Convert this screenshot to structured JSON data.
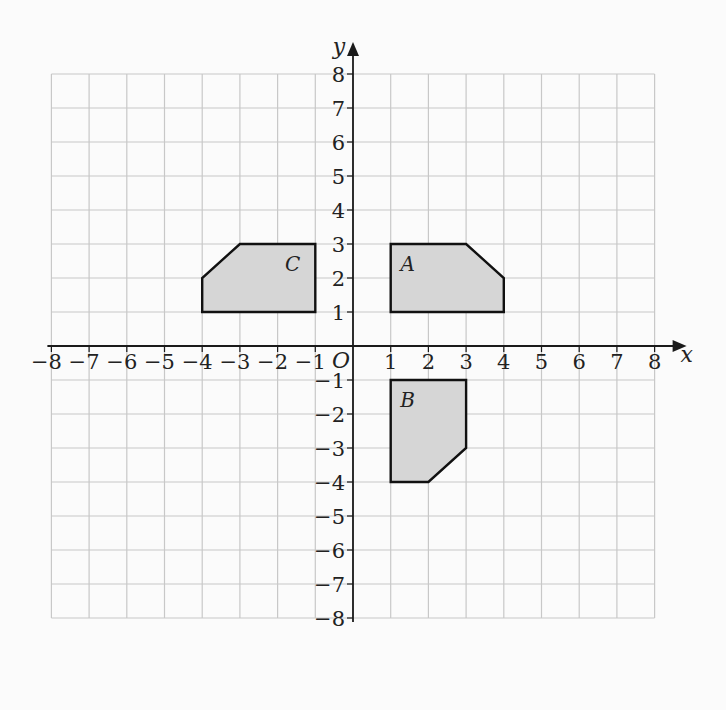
{
  "chart_data": {
    "type": "coordinate-grid",
    "title": "",
    "xlabel": "x",
    "ylabel": "y",
    "origin_label": "O",
    "xlim": [
      -8,
      8
    ],
    "ylim": [
      -8,
      8
    ],
    "grid": true,
    "x_ticks": [
      -8,
      -7,
      -6,
      -5,
      -4,
      -3,
      -2,
      -1,
      1,
      2,
      3,
      4,
      5,
      6,
      7,
      8
    ],
    "y_ticks": [
      8,
      7,
      6,
      5,
      4,
      3,
      2,
      1,
      -1,
      -2,
      -3,
      -4,
      -5,
      -6,
      -7,
      -8
    ],
    "shapes": [
      {
        "name": "A",
        "label_pos": [
          1.45,
          2.45
        ],
        "vertices": [
          [
            1,
            1
          ],
          [
            1,
            3
          ],
          [
            3,
            3
          ],
          [
            4,
            2
          ],
          [
            4,
            1
          ]
        ]
      },
      {
        "name": "B",
        "label_pos": [
          1.45,
          -1.55
        ],
        "vertices": [
          [
            1,
            -1
          ],
          [
            3,
            -1
          ],
          [
            3,
            -3
          ],
          [
            2,
            -4
          ],
          [
            1,
            -4
          ]
        ]
      },
      {
        "name": "C",
        "label_pos": [
          -1.6,
          2.45
        ],
        "vertices": [
          [
            -1,
            1
          ],
          [
            -1,
            3
          ],
          [
            -3,
            3
          ],
          [
            -4,
            2
          ],
          [
            -4,
            1
          ]
        ]
      }
    ]
  },
  "style": {
    "grid_color": "#c8c8c8",
    "axis_color": "#1a1a1a",
    "shape_fill": "#d6d6d6",
    "shape_stroke": "#111111"
  }
}
